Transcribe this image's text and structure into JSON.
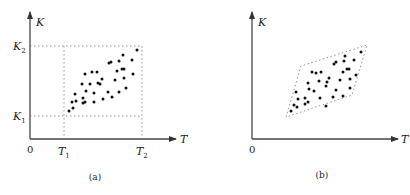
{
  "figure": {
    "panels": [
      {
        "id": "a",
        "caption": "(a)",
        "x_axis_label": "T",
        "y_axis_label": "K",
        "origin_label": "0",
        "x_ticks": [
          {
            "base": "T",
            "sub": "1"
          },
          {
            "base": "T",
            "sub": "2"
          }
        ],
        "y_ticks": [
          {
            "base": "K",
            "sub": "1"
          },
          {
            "base": "K",
            "sub": "2"
          }
        ],
        "region": "rectangle",
        "point_count": 36
      },
      {
        "id": "b",
        "caption": "(b)",
        "x_axis_label": "T",
        "y_axis_label": "K",
        "origin_label": "0",
        "region": "parallelogram",
        "point_count": 36
      }
    ]
  },
  "chart_data": [
    {
      "type": "scatter",
      "title": "(a)",
      "xlabel": "T",
      "ylabel": "K",
      "region": {
        "shape": "rectangle",
        "x_range": [
          "T1",
          "T2"
        ],
        "y_range": [
          "K1",
          "K2"
        ]
      },
      "points_px": [
        [
          69,
          111
        ],
        [
          73,
          108
        ],
        [
          72,
          102
        ],
        [
          76,
          101
        ],
        [
          75,
          94
        ],
        [
          83,
          98
        ],
        [
          83,
          103
        ],
        [
          85,
          102
        ],
        [
          86,
          91
        ],
        [
          82,
          84
        ],
        [
          85,
          74
        ],
        [
          90,
          84
        ],
        [
          92,
          72
        ],
        [
          97,
          72
        ],
        [
          94,
          93
        ],
        [
          94,
          102
        ],
        [
          98,
          83
        ],
        [
          100,
          84
        ],
        [
          102,
          79
        ],
        [
          103,
          99
        ],
        [
          108,
          92
        ],
        [
          112,
          97
        ],
        [
          109,
          63
        ],
        [
          111,
          62
        ],
        [
          115,
          80
        ],
        [
          117,
          71
        ],
        [
          119,
          92
        ],
        [
          119,
          61
        ],
        [
          122,
          69
        ],
        [
          124,
          69
        ],
        [
          123,
          55
        ],
        [
          124,
          78
        ],
        [
          126,
          88
        ],
        [
          132,
          60
        ],
        [
          133,
          74
        ],
        [
          137,
          50
        ]
      ]
    },
    {
      "type": "scatter",
      "title": "(b)",
      "xlabel": "T",
      "ylabel": "K",
      "region": {
        "shape": "parallelogram",
        "corners_px": [
          [
            286,
            117
          ],
          [
            301,
            66
          ],
          [
            367,
            45
          ],
          [
            352,
            95
          ]
        ]
      },
      "points_px": [
        [
          291,
          111
        ],
        [
          294,
          105
        ],
        [
          297,
          107
        ],
        [
          298,
          99
        ],
        [
          296,
          92
        ],
        [
          305,
          104
        ],
        [
          305,
          98
        ],
        [
          308,
          102
        ],
        [
          309,
          89
        ],
        [
          308,
          83
        ],
        [
          312,
          72
        ],
        [
          314,
          91
        ],
        [
          316,
          73
        ],
        [
          319,
          81
        ],
        [
          320,
          98
        ],
        [
          321,
          72
        ],
        [
          326,
          86
        ],
        [
          327,
          82
        ],
        [
          329,
          78
        ],
        [
          326,
          106
        ],
        [
          333,
          97
        ],
        [
          336,
          90
        ],
        [
          334,
          64
        ],
        [
          336,
          62
        ],
        [
          340,
          80
        ],
        [
          343,
          72
        ],
        [
          343,
          96
        ],
        [
          344,
          61
        ],
        [
          347,
          69
        ],
        [
          349,
          69
        ],
        [
          345,
          56
        ],
        [
          350,
          79
        ],
        [
          350,
          88
        ],
        [
          354,
          60
        ],
        [
          356,
          75
        ],
        [
          361,
          52
        ]
      ]
    }
  ]
}
